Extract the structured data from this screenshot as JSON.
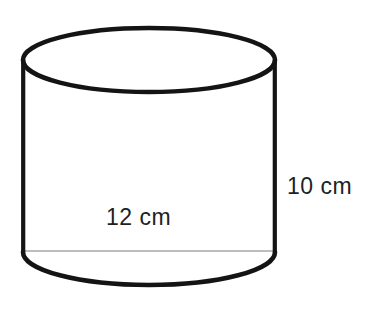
{
  "figure": {
    "kind": "geometry-diagram",
    "shape": "cylinder",
    "background_color": "#ffffff",
    "stroke_color": "#141414",
    "hidden_edge_color": "#a8a8a8",
    "text_color": "#221f1f",
    "labels": {
      "diameter": "12 cm",
      "height": "10 cm"
    },
    "measurements": [
      {
        "name": "diameter",
        "value": 12,
        "unit": "cm",
        "text": "12 cm"
      },
      {
        "name": "height",
        "value": 10,
        "unit": "cm",
        "text": "10 cm"
      }
    ],
    "geometry": {
      "left_x": 23,
      "right_x": 275,
      "top_ellipse_center_y": 60,
      "top_ellipse_ry": 32,
      "bottom_ellipse_center_y": 252,
      "bottom_ellipse_ry": 33,
      "rx": 126,
      "stroke_width": 4.5,
      "hidden_line_width": 1.6
    }
  }
}
